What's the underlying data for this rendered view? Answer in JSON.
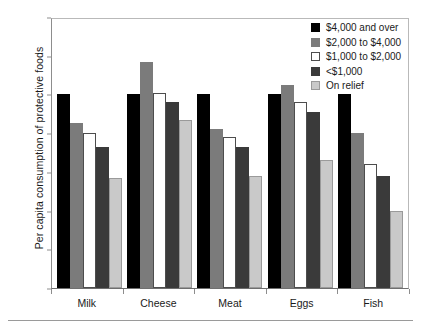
{
  "chart_data": {
    "type": "bar",
    "title": "",
    "xlabel": "",
    "ylabel": "Per capita consumption of protective foods",
    "ylim": [
      0,
      140
    ],
    "ytick_step": 20,
    "yticks": [
      0,
      20,
      40,
      60,
      80,
      100,
      120,
      140
    ],
    "grid": false,
    "legend_position": "top-right",
    "categories": [
      "Milk",
      "Cheese",
      "Meat",
      "Eggs",
      "Fish"
    ],
    "series": [
      {
        "name": "$4,000 and over",
        "color": "#000000",
        "values": [
          100,
          100,
          100,
          100,
          100
        ]
      },
      {
        "name": "$2,000 to $4,000",
        "color": "#7b7b7b",
        "values": [
          85,
          117,
          82,
          105,
          80
        ]
      },
      {
        "name": "$1,000 to $2,000",
        "color": "#ffffff",
        "values": [
          80,
          101,
          78,
          96,
          64
        ]
      },
      {
        "name": "<$1,000",
        "color": "#3a3a3a",
        "values": [
          73,
          96,
          73,
          91,
          58
        ]
      },
      {
        "name": "On relief",
        "color": "#c9c9c9",
        "values": [
          57,
          87,
          58,
          66,
          40
        ]
      }
    ]
  }
}
